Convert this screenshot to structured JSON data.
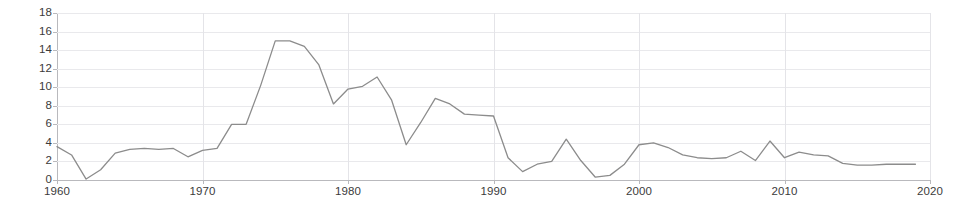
{
  "chart_data": {
    "type": "line",
    "title": "",
    "subtitle": "",
    "xlabel": "",
    "ylabel": "",
    "xlim": [
      1960,
      2020
    ],
    "ylim": [
      0,
      18
    ],
    "y_ticks": [
      0,
      2,
      4,
      6,
      8,
      10,
      12,
      14,
      16,
      18
    ],
    "x_ticks": [
      1960,
      1970,
      1980,
      1990,
      2000,
      2010,
      2020
    ],
    "grid": true,
    "legend": "none",
    "line_color": "#8c8c8c",
    "grid_color": "#e9e9ec",
    "axis_color": "#b9b9bd",
    "text_color": "#3b3b3b",
    "background": "#ffffff",
    "series": [
      {
        "name": "series-1",
        "x": [
          1960,
          1961,
          1962,
          1963,
          1964,
          1965,
          1966,
          1967,
          1968,
          1969,
          1970,
          1971,
          1972,
          1973,
          1974,
          1975,
          1976,
          1977,
          1978,
          1979,
          1980,
          1981,
          1982,
          1983,
          1984,
          1985,
          1986,
          1987,
          1988,
          1989,
          1990,
          1991,
          1992,
          1993,
          1994,
          1995,
          1996,
          1997,
          1998,
          1999,
          2000,
          2001,
          2002,
          2003,
          2004,
          2005,
          2006,
          2007,
          2008,
          2009,
          2010,
          2011,
          2012,
          2013,
          2014,
          2015,
          2016,
          2017,
          2018,
          2019
        ],
        "values": [
          3.6,
          2.7,
          0.1,
          1.1,
          2.9,
          3.3,
          3.4,
          3.3,
          3.4,
          2.5,
          3.2,
          3.4,
          6.0,
          6.0,
          10.2,
          15.0,
          15.0,
          14.4,
          12.4,
          8.2,
          9.8,
          10.1,
          11.1,
          8.6,
          3.8,
          6.2,
          8.8,
          8.2,
          7.1,
          7.0,
          6.9,
          2.4,
          0.9,
          1.7,
          2.0,
          4.4,
          2.1,
          0.3,
          0.5,
          1.7,
          3.8,
          4.0,
          3.5,
          2.7,
          2.4,
          2.3,
          2.4,
          3.1,
          2.1,
          4.2,
          2.4,
          3.0,
          2.7,
          2.6,
          1.8,
          1.6,
          1.6,
          1.7,
          1.7,
          1.7
        ]
      }
    ]
  }
}
